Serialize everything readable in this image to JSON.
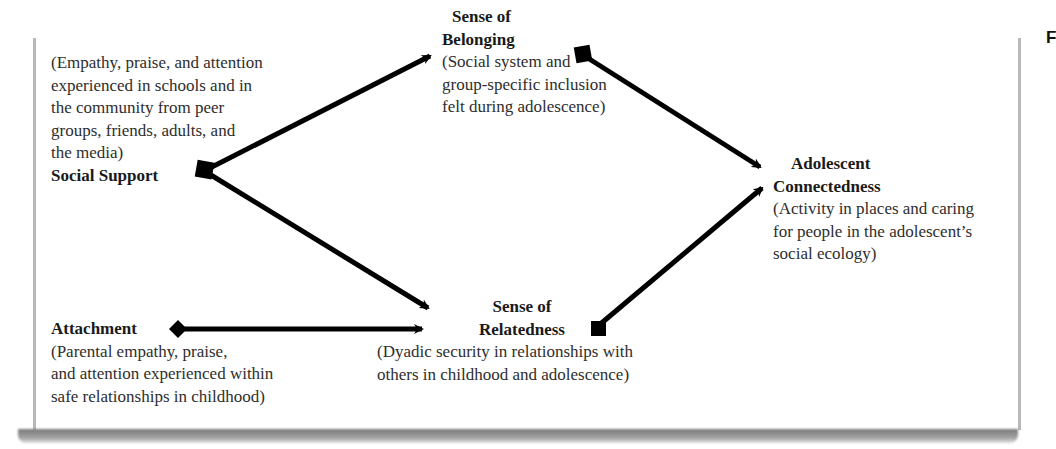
{
  "edge_fragment": "F",
  "nodes": {
    "social_support": {
      "title": "Social Support",
      "desc_lines": [
        "(Empathy, praise, and attention",
        "experienced in schools and in",
        "the community from peer",
        "groups, friends, adults, and",
        "the media)"
      ]
    },
    "sense_of_belonging": {
      "title_lines": [
        "Sense of",
        "Belonging"
      ],
      "desc_lines": [
        "(Social system and",
        "group-specific inclusion",
        "felt during adolescence)"
      ]
    },
    "adolescent_connectedness": {
      "title_lines": [
        "Adolescent",
        "Connectedness"
      ],
      "desc_lines": [
        "(Activity in places and caring",
        "for people in the adolescent’s",
        "social ecology)"
      ]
    },
    "attachment": {
      "title": "Attachment",
      "desc_lines": [
        "(Parental empathy, praise,",
        "and attention experienced within",
        "safe relationships in childhood)"
      ]
    },
    "sense_of_relatedness": {
      "title_lines": [
        "Sense of",
        "Relatedness"
      ],
      "desc_lines": [
        "(Dyadic security in relationships with",
        "others in childhood and adolescence)"
      ]
    }
  },
  "edges": [
    {
      "from": "Social Support",
      "to": "Sense of Belonging"
    },
    {
      "from": "Social Support",
      "to": "Sense of Relatedness"
    },
    {
      "from": "Attachment",
      "to": "Sense of Relatedness"
    },
    {
      "from": "Sense of Belonging",
      "to": "Adolescent Connectedness"
    },
    {
      "from": "Sense of Relatedness",
      "to": "Adolescent Connectedness"
    }
  ]
}
